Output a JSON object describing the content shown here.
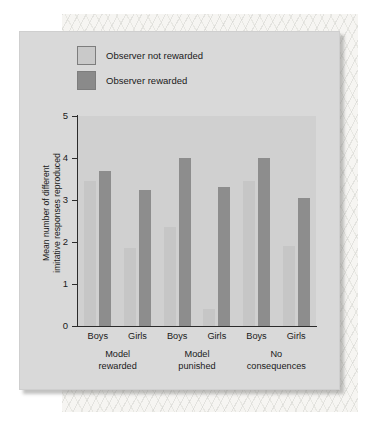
{
  "figure": {
    "legend": {
      "items": [
        {
          "label": "Observer not rewarded",
          "swatch": "light",
          "color": "#c9c9c9"
        },
        {
          "label": "Observer rewarded",
          "swatch": "dark",
          "color": "#8a8a8a"
        }
      ]
    },
    "y_axis_title_line1": "Mean number of different",
    "y_axis_title_line2": "imitative responses reproduced",
    "y_ticks": [
      "0",
      "1",
      "2",
      "3",
      "4",
      "5"
    ]
  },
  "chart_data": {
    "type": "bar",
    "title": "",
    "xlabel": "",
    "ylabel": "Mean number of different imitative responses reproduced",
    "ylim": [
      0,
      5
    ],
    "ytick_values": [
      0,
      1,
      2,
      3,
      4,
      5
    ],
    "grid": false,
    "legend_position": "top-left",
    "groups": [
      {
        "label_line1": "Model",
        "label_line2": "rewarded"
      },
      {
        "label_line1": "Model",
        "label_line2": "punished"
      },
      {
        "label_line1": "No",
        "label_line2": "consequences"
      }
    ],
    "categories": [
      "Model rewarded / Boys",
      "Model rewarded / Girls",
      "Model punished / Boys",
      "Model punished / Girls",
      "No consequences / Boys",
      "No consequences / Girls"
    ],
    "subcategories": [
      "Boys",
      "Girls",
      "Boys",
      "Girls",
      "Boys",
      "Girls"
    ],
    "series": [
      {
        "name": "Observer not rewarded",
        "color": "#c6c6c6",
        "values": [
          3.45,
          1.85,
          2.35,
          0.4,
          3.45,
          1.9
        ]
      },
      {
        "name": "Observer rewarded",
        "color": "#8d8d8d",
        "values": [
          3.7,
          3.25,
          4.0,
          3.3,
          4.0,
          3.05
        ]
      }
    ]
  }
}
